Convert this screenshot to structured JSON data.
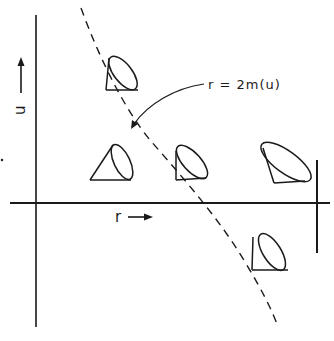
{
  "diagram": {
    "type": "spacetime-light-cone-diagram",
    "axes": {
      "vertical": {
        "label": "u",
        "direction_arrow": "up-arrow"
      },
      "horizontal": {
        "label": "r",
        "direction_arrow": "right-arrow"
      }
    },
    "curve": {
      "style": "dashed",
      "label": "r = 2m(u)",
      "label_arrow": "curved-pointer-arrow"
    },
    "light_cones": [
      {
        "name": "cone-upper-left",
        "region": "outside",
        "tilt": "outward"
      },
      {
        "name": "cone-left-middle",
        "region": "outside",
        "tilt": "outward"
      },
      {
        "name": "cone-center",
        "region": "at-surface",
        "tilt": "vertical-edge"
      },
      {
        "name": "cone-right",
        "region": "inside",
        "tilt": "inward"
      },
      {
        "name": "cone-lower",
        "region": "inside",
        "tilt": "inward"
      }
    ],
    "colors": {
      "ink": "#1a1a1a",
      "background": "#ffffff"
    }
  }
}
